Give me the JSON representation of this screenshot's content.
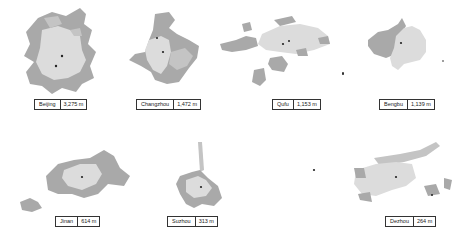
{
  "figure": {
    "colors": {
      "core": "#dcdcdc",
      "outer": "#a9a9a9",
      "center_dot": "#222222",
      "background": "#ffffff"
    },
    "cities": [
      {
        "name": "Beijing",
        "value": "3,275 m"
      },
      {
        "name": "Changzhou",
        "value": "1,472 m"
      },
      {
        "name": "Qufu",
        "value": "1,153 m"
      },
      {
        "name": "Bengbu",
        "value": "1,139 m"
      },
      {
        "name": "Jinan",
        "value": "614 m"
      },
      {
        "name": "Suzhou",
        "value": "313 m"
      },
      {
        "name": "Dezhou",
        "value": "264 m"
      }
    ]
  }
}
